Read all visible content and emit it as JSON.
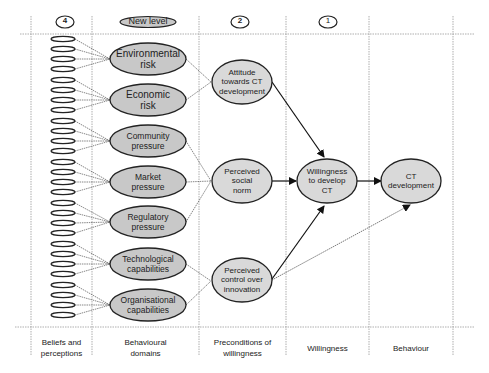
{
  "diagram": {
    "column_markers": [
      {
        "id": "col4",
        "label": "4"
      },
      {
        "id": "new-level",
        "label": "New level"
      },
      {
        "id": "col2",
        "label": "2"
      },
      {
        "id": "col1",
        "label": "1"
      }
    ],
    "columns": [
      {
        "label": "Beliefs and\nperceptions",
        "line1": "Beliefs and",
        "line2": "perceptions"
      },
      {
        "label": "Behavioural domains",
        "line1": "Behavioural",
        "line2": "domains"
      },
      {
        "label": "Preconditions of willingness",
        "line1": "Preconditions of",
        "line2": "willingness"
      },
      {
        "label": "Willingness",
        "line1": "Willingness",
        "line2": ""
      },
      {
        "label": "Behaviour",
        "line1": "Behaviour",
        "line2": ""
      }
    ],
    "domains": [
      {
        "line1": "Environmental",
        "line2": "risk"
      },
      {
        "line1": "Economic",
        "line2": "risk"
      },
      {
        "line1": "Community",
        "line2": "pressure"
      },
      {
        "line1": "Market",
        "line2": "pressure"
      },
      {
        "line1": "Regulatory",
        "line2": "pressure"
      },
      {
        "line1": "Technological",
        "line2": "capabilities"
      },
      {
        "line1": "Organisational",
        "line2": "capabilities"
      }
    ],
    "preconditions": [
      {
        "line1": "Attitude",
        "line2": "towards CT",
        "line3": "development"
      },
      {
        "line1": "Perceived",
        "line2": "social",
        "line3": "norm"
      },
      {
        "line1": "Perceived",
        "line2": "control over",
        "line3": "innovation"
      }
    ],
    "willingness": {
      "line1": "Willingness",
      "line2": "to develop",
      "line3": "CT"
    },
    "behaviour": {
      "line1": "CT",
      "line2": "development"
    },
    "beliefs_per_domain": 4,
    "colors": {
      "node_fill": "#c8c8c8",
      "node_fill_light": "#d9d9d9",
      "stroke": "#222222",
      "grid": "#9a9a9a"
    }
  }
}
